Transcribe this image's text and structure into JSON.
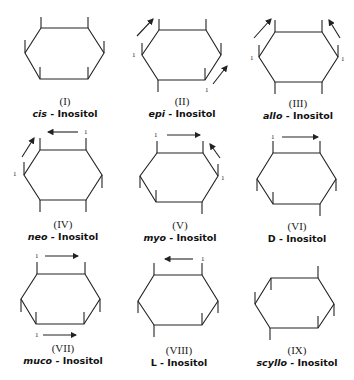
{
  "compounds": [
    {
      "numeral": "(I)",
      "prefix": "cis",
      "suffix": " - Inositol"
    },
    {
      "numeral": "(II)",
      "prefix": "epi",
      "suffix": " - Inositol"
    },
    {
      "numeral": "(III)",
      "prefix": "allo",
      "suffix": " - Inositol"
    },
    {
      "numeral": "(IV)",
      "prefix": "neo",
      "suffix": " - Inositol"
    },
    {
      "numeral": "(V)",
      "prefix": "myo",
      "suffix": " - Inositol"
    },
    {
      "numeral": "(VI)",
      "prefix": "D",
      "suffix": " - Inositol"
    },
    {
      "numeral": "(VII)",
      "prefix": "muco",
      "suffix": " - Inositol"
    },
    {
      "numeral": "(VIII)",
      "prefix": "L",
      "suffix": " - Inositol"
    },
    {
      "numeral": "(IX)",
      "prefix": "scyllo",
      "suffix": " - Inositol"
    }
  ],
  "position_label": "1",
  "colors": {
    "line": "#222222",
    "background": "#ffffff"
  }
}
